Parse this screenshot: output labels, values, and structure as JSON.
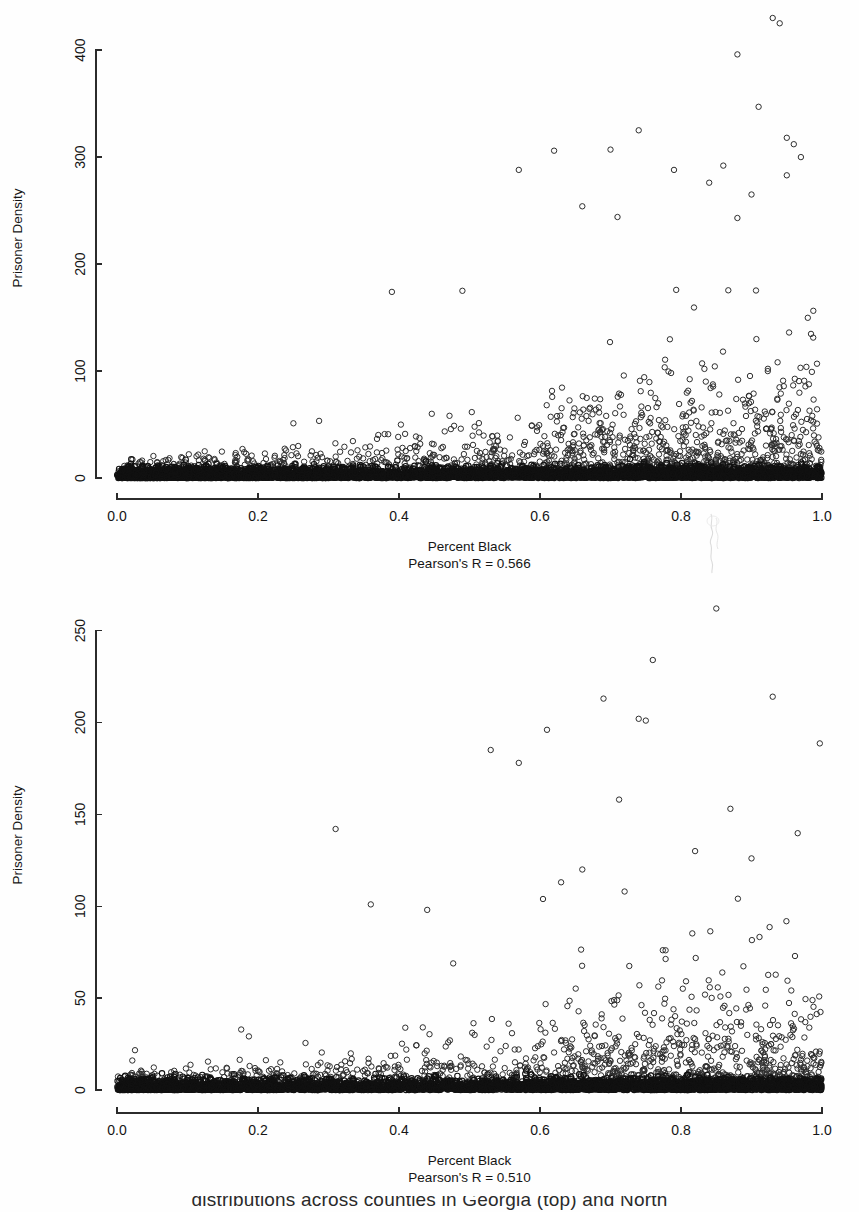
{
  "figure": {
    "background_color": "#fefefe",
    "marker_color": "#2e2e2e",
    "axis_color": "#2b2b2b",
    "partial_caption": "distributions across counties in Georgia (top) and North"
  },
  "chart_data": [
    {
      "id": "top",
      "type": "scatter",
      "title": "",
      "xlabel": "Percent Black",
      "ylabel": "Prisoner Density",
      "annotation": "Pearson's R = 0.566",
      "pearson_r": 0.566,
      "xlim": [
        0.0,
        1.0
      ],
      "ylim": [
        0,
        430
      ],
      "xticks": [
        0.0,
        0.2,
        0.4,
        0.6,
        0.8,
        1.0
      ],
      "xtick_labels": [
        "0.0",
        "0.2",
        "0.4",
        "0.6",
        "0.8",
        "1.0"
      ],
      "yticks": [
        0,
        100,
        200,
        300,
        400
      ],
      "ytick_labels": [
        "0",
        "100",
        "200",
        "300",
        "400"
      ],
      "grid": false,
      "legend": null,
      "marker": "open-circle",
      "n_points_approx": 3100,
      "description": "Dense saturated band of points near y=0 spanning the full x range; scatter spreads upward and to the right, with highest prisoner densities concentrated at percent black above 0.8. A few outliers exceed 400 and are clipped at the top of the frame."
    },
    {
      "id": "bottom",
      "type": "scatter",
      "title": "",
      "xlabel": "Percent Black",
      "ylabel": "Prisoner Density",
      "annotation": "Pearson's R = 0.510",
      "pearson_r": 0.51,
      "xlim": [
        0.0,
        1.0
      ],
      "ylim": [
        0,
        265
      ],
      "xticks": [
        0.0,
        0.2,
        0.4,
        0.6,
        0.8,
        1.0
      ],
      "xtick_labels": [
        "0.0",
        "0.2",
        "0.4",
        "0.6",
        "0.8",
        "1.0"
      ],
      "yticks": [
        0,
        50,
        100,
        150,
        200,
        250
      ],
      "ytick_labels": [
        "0",
        "50",
        "100",
        "150",
        "200",
        "250"
      ],
      "grid": false,
      "legend": null,
      "marker": "open-circle",
      "n_points_approx": 2600,
      "description": "Dense saturated band of points near y=0 across the full x range; upward spread increases with percent black. Highest outlier near 262 at x about 0.85, with several points between 180 and 235 between x 0.5 and 0.95."
    }
  ]
}
